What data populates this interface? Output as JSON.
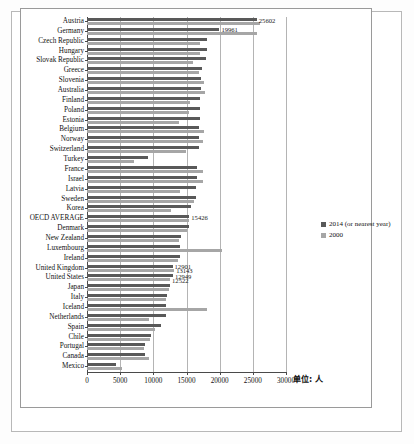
{
  "chart_data": {
    "type": "bar",
    "orientation": "horizontal",
    "title": "",
    "xlabel": "",
    "ylabel": "",
    "unit_note": "单位: 人",
    "xlim": [
      0,
      30000
    ],
    "xticks": [
      0,
      5000,
      10000,
      15000,
      20000,
      25000,
      30000
    ],
    "xticklabels": [
      "0",
      "5000",
      "10000",
      "15000",
      "20000",
      "25000",
      "30000"
    ],
    "grid": true,
    "legend_position": "right",
    "categories": [
      "Austria",
      "Germany",
      "Czech Republic",
      "Hungary",
      "Slovak Republic",
      "Greece",
      "Slovenia",
      "Australia",
      "Finland",
      "Poland",
      "Estonia",
      "Belgium",
      "Norway",
      "Switzerland",
      "Turkey",
      "France",
      "Israel",
      "Latvia",
      "Sweden",
      "Korea",
      "OECD AVERAGE",
      "Denmark",
      "New Zealand",
      "Luxembourg",
      "Ireland",
      "United Kingdom",
      "United States",
      "Japan",
      "Italy",
      "Iceland",
      "Netherlands",
      "Spain",
      "Chile",
      "Portugal",
      "Canada",
      "Mexico"
    ],
    "series": [
      {
        "name": "2014 (or nearest year)",
        "color": "#595959",
        "values": [
          25602,
          19961,
          18100,
          18050,
          18000,
          17400,
          17200,
          17150,
          17100,
          17050,
          17000,
          16950,
          16900,
          16850,
          9150,
          16600,
          16550,
          16500,
          16450,
          15700,
          15426,
          15350,
          14100,
          14050,
          14000,
          12901,
          12949,
          12500,
          12000,
          11950,
          11900,
          11100,
          9600,
          8800,
          8750,
          4300
        ]
      },
      {
        "name": "2000",
        "color": "#a6a6a6",
        "values": [
          26100,
          25602,
          17000,
          17000,
          16000,
          16950,
          17700,
          17800,
          15500,
          15400,
          13800,
          17600,
          17550,
          14900,
          7050,
          17500,
          17450,
          14000,
          16100,
          12600,
          15426,
          15100,
          13900,
          20300,
          13700,
          13143,
          12522,
          12350,
          11850,
          18100,
          9400,
          10300,
          9500,
          8600,
          9300,
          5250
        ]
      }
    ],
    "data_labels": [
      {
        "text": "25602",
        "category": "Austria",
        "series": "2014 (or nearest year)"
      },
      {
        "text": "19961",
        "category": "Germany",
        "series": "2014 (or nearest year)"
      },
      {
        "text": "15426",
        "category": "OECD AVERAGE",
        "series": "2014 (or nearest year)"
      },
      {
        "text": "12901",
        "category": "United Kingdom",
        "series": "2014 (or nearest year)"
      },
      {
        "text": "13143",
        "category": "United Kingdom",
        "series": "2000"
      },
      {
        "text": "12949",
        "category": "United States",
        "series": "2014 (or nearest year)"
      },
      {
        "text": "12522",
        "category": "United States",
        "series": "2000"
      }
    ]
  },
  "legend": {
    "items": [
      {
        "label": "2014 (or nearest year)",
        "color": "#595959"
      },
      {
        "label": "2000",
        "color": "#a6a6a6"
      }
    ]
  }
}
